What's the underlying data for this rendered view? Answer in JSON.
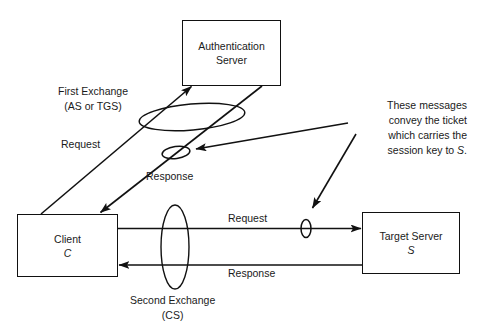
{
  "diagram": {
    "stroke_color": "#111111",
    "background_color": "#ffffff",
    "nodes": [
      {
        "id": "auth-server",
        "name": "authentication-server-node",
        "line1": "Authentication",
        "line2": "Server"
      },
      {
        "id": "client",
        "name": "client-node",
        "line1": "Client",
        "line2": "C"
      },
      {
        "id": "target-server",
        "name": "target-server-node",
        "line1": "Target Server",
        "line2": "S"
      }
    ],
    "edge_labels": {
      "first_request": "Request",
      "first_response": "Response",
      "second_request": "Request",
      "second_response": "Response"
    },
    "captions": {
      "first_exchange_line1": "First Exchange",
      "first_exchange_line2": "(AS or TGS)",
      "second_exchange_line1": "Second Exchange",
      "second_exchange_line2": "(CS)"
    },
    "note": {
      "line1": "These messages",
      "line2": "convey the ticket",
      "line3": "which carries the",
      "line4_prefix": "session key to ",
      "line4_italic": "S",
      "line4_suffix": "."
    }
  }
}
